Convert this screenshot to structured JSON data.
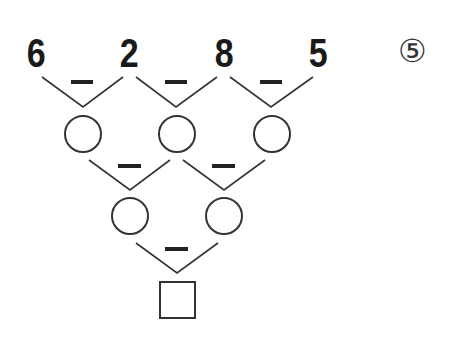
{
  "problem": {
    "label": "⑤",
    "top_numbers": [
      "6",
      "2",
      "8",
      "5"
    ],
    "operator": "−",
    "row2_blanks": 3,
    "row3_blanks": 2,
    "answer_box": "",
    "colors": {
      "ink": "#1a1a1a",
      "line": "#333333",
      "background": "#ffffff"
    }
  }
}
